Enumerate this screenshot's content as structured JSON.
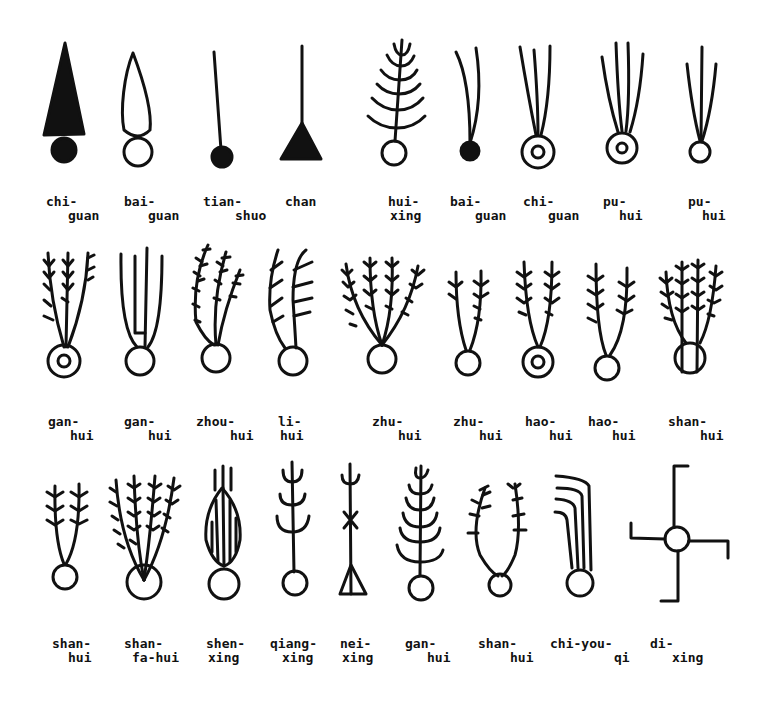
{
  "figure": {
    "rows": [
      {
        "items": [
          {
            "l1": "chi-",
            "l2": "guan",
            "x": 46,
            "y": 195
          },
          {
            "l1": "bai-",
            "l2": "guan",
            "x": 124,
            "y": 195
          },
          {
            "l1": "tian-",
            "l2": "shuo",
            "x": 203,
            "y": 195
          },
          {
            "l1": "chan",
            "l2": "",
            "x": 285,
            "y": 195
          },
          {
            "l1": "hui-",
            "l2": "xing",
            "x": 388,
            "y": 195
          },
          {
            "l1": "bai-",
            "l2": "guan",
            "x": 450,
            "y": 195
          },
          {
            "l1": "chi-",
            "l2": "guan",
            "x": 523,
            "y": 195
          },
          {
            "l1": "pu-",
            "l2": "hui",
            "x": 603,
            "y": 195
          },
          {
            "l1": "pu-",
            "l2": "hui",
            "x": 688,
            "y": 195
          }
        ]
      },
      {
        "items": [
          {
            "l1": "gan-",
            "l2": "hui",
            "x": 48,
            "y": 415
          },
          {
            "l1": "gan-",
            "l2": "hui",
            "x": 124,
            "y": 415
          },
          {
            "l1": "zhou-",
            "l2": "hui",
            "x": 196,
            "y": 415
          },
          {
            "l1": "li-",
            "l2": "hui",
            "x": 278,
            "y": 415
          },
          {
            "l1": "zhu-",
            "l2": "hui",
            "x": 372,
            "y": 415
          },
          {
            "l1": "zhu-",
            "l2": "hui",
            "x": 453,
            "y": 415
          },
          {
            "l1": "hao-",
            "l2": "hui",
            "x": 525,
            "y": 415
          },
          {
            "l1": "hao-",
            "l2": "hui",
            "x": 588,
            "y": 415
          },
          {
            "l1": "shan-",
            "l2": "hui",
            "x": 668,
            "y": 415
          }
        ]
      },
      {
        "items": [
          {
            "l1": "shan-",
            "l2": "hui",
            "x": 52,
            "y": 637
          },
          {
            "l1": "shan-",
            "l2": "fa-hui",
            "x": 124,
            "y": 637
          },
          {
            "l1": "shen-",
            "l2": "xing",
            "x": 206,
            "y": 637
          },
          {
            "l1": "qiang-",
            "l2": "xing",
            "x": 270,
            "y": 637
          },
          {
            "l1": "nei-",
            "l2": "xing",
            "x": 340,
            "y": 637
          },
          {
            "l1": "gan-",
            "l2": "hui",
            "x": 405,
            "y": 637
          },
          {
            "l1": "shan-",
            "l2": "hui",
            "x": 478,
            "y": 637
          },
          {
            "l1": "chi-you-",
            "l2": "qi",
            "x": 550,
            "y": 637
          },
          {
            "l1": "di-",
            "l2": "xing",
            "x": 650,
            "y": 637
          }
        ]
      }
    ],
    "ink_color": "#111111",
    "background": "#ffffff"
  }
}
